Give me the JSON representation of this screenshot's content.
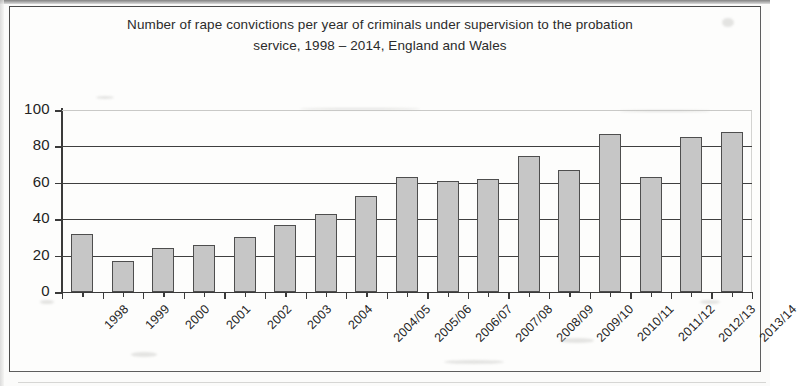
{
  "chart_data": {
    "type": "bar",
    "title": "Number of rape convictions per year of criminals under supervision to the probation service, 1998 – 2014, England and Wales",
    "title_line1": "Number of rape convictions per year of criminals under supervision to the probation",
    "title_line2": "service, 1998 – 2014, England and Wales",
    "xlabel": "",
    "ylabel": "",
    "ylim": [
      0,
      100
    ],
    "ytick_labels": [
      "100",
      "80",
      "60",
      "40",
      "20",
      "0"
    ],
    "ytick_values": [
      100,
      80,
      60,
      40,
      20,
      0
    ],
    "grid": true,
    "legend": "none",
    "categories": [
      "1998",
      "1999",
      "2000",
      "2001",
      "2002",
      "2003",
      "2004",
      "2004/05",
      "2005/06",
      "2006/07",
      "2007/08",
      "2008/09",
      "2009/10",
      "2010/11",
      "2011/12",
      "2012/13",
      "2013/14"
    ],
    "values": [
      32,
      17,
      24,
      26,
      30,
      37,
      43,
      53,
      63,
      61,
      62,
      75,
      67,
      87,
      63,
      85,
      88
    ],
    "bar_color": "#c6c6c6",
    "bar_border_color": "#4e4e4e",
    "axis_color": "#3a3a3a"
  }
}
